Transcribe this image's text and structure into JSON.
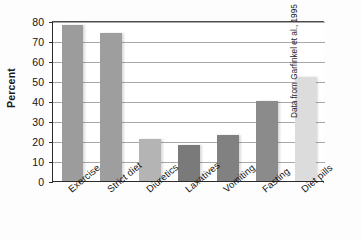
{
  "chart_data": {
    "type": "bar",
    "title": "",
    "xlabel": "",
    "ylabel": "Percent",
    "categories": [
      "Exercise",
      "Strict diet",
      "Diuretics",
      "Laxatives",
      "Vomiting",
      "Fasting",
      "Diet pills"
    ],
    "values": [
      78,
      74,
      21,
      18,
      23,
      40,
      52
    ],
    "ylim": [
      0,
      80
    ],
    "yticks": [
      0,
      10,
      20,
      30,
      40,
      50,
      60,
      70,
      80
    ],
    "ytick_labels": [
      "0",
      "10",
      "20",
      "30",
      "40",
      "50",
      "60",
      "70",
      "80"
    ],
    "grid": true,
    "grid_axis": "y",
    "legend": false,
    "bar_colors": [
      "#9c9c9c",
      "#9e9e9e",
      "#b4b4b4",
      "#7a7a7a",
      "#818181",
      "#8b8b8b",
      "#dcdcdc"
    ],
    "annotation": "Data from Garfinkel et al., 1995"
  },
  "axis": {
    "y_title": "Percent"
  },
  "credit": {
    "text": "Data from Garfinkel et al., 1995"
  }
}
